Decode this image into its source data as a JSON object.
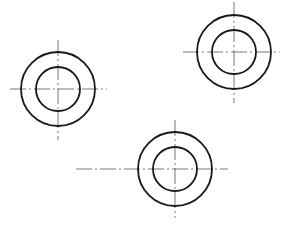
{
  "canvas": {
    "width": 299,
    "height": 229,
    "background": "#ffffff"
  },
  "style": {
    "circle_stroke": "#1a1a1a",
    "centerline_stroke": "#555555"
  },
  "parts": [
    {
      "name": "left",
      "cx": 58,
      "cy": 89,
      "r_outer": 37,
      "r_inner": 22,
      "h_line": {
        "x1": 10,
        "x2": 107
      },
      "v_line": {
        "y1": 40,
        "y2": 140
      }
    },
    {
      "name": "top-right",
      "cx": 234,
      "cy": 52,
      "r_outer": 37,
      "r_inner": 22,
      "h_line": {
        "x1": 183,
        "x2": 280
      },
      "v_line": {
        "y1": 2,
        "y2": 103
      }
    },
    {
      "name": "bottom",
      "cx": 175,
      "cy": 169,
      "r_outer": 37,
      "r_inner": 22,
      "h_line": {
        "x1": 76,
        "x2": 228
      },
      "v_line": {
        "y1": 120,
        "y2": 218
      }
    }
  ]
}
